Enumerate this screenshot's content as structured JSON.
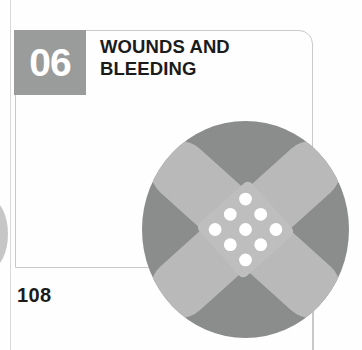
{
  "page": {
    "width": 362,
    "height": 350,
    "background": "#fefefe"
  },
  "chapter": {
    "number": "06",
    "title": "WOUNDS AND\nBLEEDING",
    "title_line_1": "WOUNDS AND",
    "title_line_2": "BLEEDING",
    "badge_color": "#9a9b9b",
    "badge_text_color": "#ffffff",
    "title_color": "#1b1b1b"
  },
  "page_number": {
    "label": "108",
    "color": "#1b1b1b"
  },
  "frame": {
    "border_color": "#c9c9c9"
  },
  "icon": {
    "name": "adhesive-bandage-icon",
    "circle_color": "#8b8c8c",
    "bandage_color": "#b9b9b9",
    "dot_color": "#ffffff",
    "dot_count": 9
  },
  "artifacts": {
    "gutter_line_color": "#d8d8d8",
    "bleed_circle_color": "#9a9a9a"
  }
}
